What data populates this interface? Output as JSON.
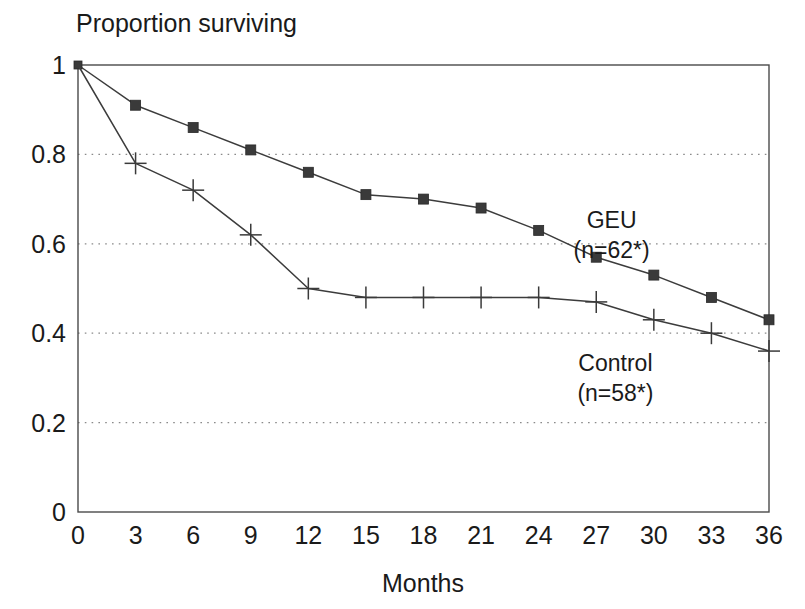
{
  "chart_data": {
    "type": "line",
    "title": "Proportion surviving",
    "xlabel": "Months",
    "ylabel": "",
    "xlim": [
      0,
      36
    ],
    "ylim": [
      0,
      1
    ],
    "grid": true,
    "legend_position": "inline-annotation",
    "x": [
      0,
      3,
      6,
      9,
      12,
      15,
      18,
      21,
      24,
      27,
      30,
      33,
      36
    ],
    "xticks": [
      "0",
      "3",
      "6",
      "9",
      "12",
      "15",
      "18",
      "21",
      "24",
      "27",
      "30",
      "33",
      "36"
    ],
    "yticks": [
      "0",
      "0.2",
      "0.4",
      "0.6",
      "0.8",
      "1"
    ],
    "ytick_values": [
      0,
      0.2,
      0.4,
      0.6,
      0.8,
      1
    ],
    "gridline_values": [
      0.2,
      0.4,
      0.6,
      0.8
    ],
    "series": [
      {
        "name": "GEU",
        "annotation_line1": "GEU",
        "annotation_line2": "(n=62*)",
        "marker": "square",
        "values": [
          1.0,
          0.91,
          0.86,
          0.81,
          0.76,
          0.71,
          0.7,
          0.68,
          0.63,
          0.57,
          0.53,
          0.48,
          0.43
        ],
        "annotation_at": {
          "x": 27.8,
          "y": 0.635
        }
      },
      {
        "name": "Control",
        "annotation_line1": "Control",
        "annotation_line2": "(n=58*)",
        "marker": "plus",
        "values": [
          1.0,
          0.78,
          0.72,
          0.62,
          0.5,
          0.48,
          0.48,
          0.48,
          0.48,
          0.47,
          0.43,
          0.4,
          0.36
        ],
        "annotation_at": {
          "x": 28.0,
          "y": 0.315
        }
      }
    ],
    "colors": {
      "line": "#3c3c3c",
      "axis": "#4a4a4a",
      "grid": "#8a8a8a",
      "text": "#1a1a1a",
      "background": "#ffffff"
    }
  }
}
